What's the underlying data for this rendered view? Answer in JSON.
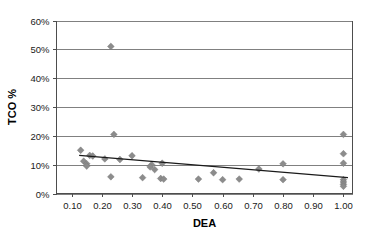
{
  "chart_data": {
    "type": "scatter",
    "title": "",
    "xlabel": "DEA",
    "ylabel": "TCO %",
    "xlim": [
      0.05,
      1.03
    ],
    "ylim": [
      0,
      0.6
    ],
    "grid": true,
    "legend": false,
    "x_tick_labels": [
      "0.10",
      "0.20",
      "0.30",
      "0.40",
      "0.50",
      "0.60",
      "0.70",
      "0.80",
      "0.90",
      "1.00"
    ],
    "x_tick_values": [
      0.1,
      0.2,
      0.3,
      0.4,
      0.5,
      0.6,
      0.7,
      0.8,
      0.9,
      1.0
    ],
    "y_tick_labels": [
      "0%",
      "10%",
      "20%",
      "30%",
      "40%",
      "50%",
      "60%"
    ],
    "y_tick_values": [
      0,
      0.1,
      0.2,
      0.3,
      0.4,
      0.5,
      0.6
    ],
    "marker_shape": "diamond",
    "marker_color": "#8c8c8c",
    "trendline_color": "#1a1a1a",
    "gridline_color": "#808080",
    "points": [
      {
        "x": 0.23,
        "y": 0.51
      },
      {
        "x": 0.24,
        "y": 0.205
      },
      {
        "x": 1.0,
        "y": 0.205
      },
      {
        "x": 0.13,
        "y": 0.15
      },
      {
        "x": 1.0,
        "y": 0.138
      },
      {
        "x": 0.16,
        "y": 0.132
      },
      {
        "x": 0.17,
        "y": 0.13
      },
      {
        "x": 0.3,
        "y": 0.131
      },
      {
        "x": 0.21,
        "y": 0.12
      },
      {
        "x": 0.14,
        "y": 0.112
      },
      {
        "x": 0.15,
        "y": 0.103
      },
      {
        "x": 0.15,
        "y": 0.095
      },
      {
        "x": 0.26,
        "y": 0.118
      },
      {
        "x": 0.4,
        "y": 0.105
      },
      {
        "x": 0.8,
        "y": 0.103
      },
      {
        "x": 1.0,
        "y": 0.105
      },
      {
        "x": 0.365,
        "y": 0.1
      },
      {
        "x": 0.36,
        "y": 0.092
      },
      {
        "x": 0.375,
        "y": 0.083
      },
      {
        "x": 0.72,
        "y": 0.085
      },
      {
        "x": 0.57,
        "y": 0.072
      },
      {
        "x": 0.23,
        "y": 0.058
      },
      {
        "x": 0.335,
        "y": 0.055
      },
      {
        "x": 0.395,
        "y": 0.052
      },
      {
        "x": 0.405,
        "y": 0.05
      },
      {
        "x": 0.52,
        "y": 0.05
      },
      {
        "x": 0.6,
        "y": 0.048
      },
      {
        "x": 0.655,
        "y": 0.05
      },
      {
        "x": 0.8,
        "y": 0.048
      },
      {
        "x": 1.0,
        "y": 0.048
      },
      {
        "x": 1.0,
        "y": 0.04
      },
      {
        "x": 1.0,
        "y": 0.032
      },
      {
        "x": 1.0,
        "y": 0.025
      }
    ],
    "trendline": {
      "x_start": 0.125,
      "y_start": 0.132,
      "x_end": 1.015,
      "y_end": 0.055,
      "equation_note": ""
    }
  }
}
